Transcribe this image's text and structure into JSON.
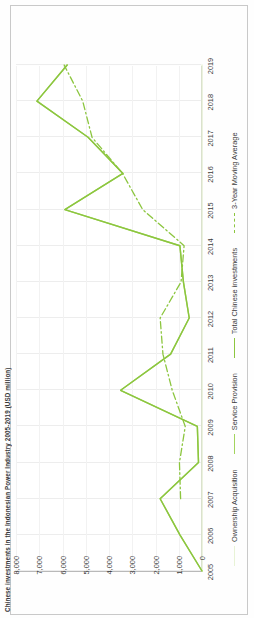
{
  "title": "Chinese investments in the Indonesian Power Industry 2005-2019 (USD million)",
  "axis": {
    "y_ticks": [
      "8,000",
      "7,000",
      "6,000",
      "5,000",
      "4,000",
      "3,000",
      "2,000",
      "1,000",
      "0"
    ],
    "x_ticks": [
      "2005",
      "2006",
      "2007",
      "2008",
      "2009",
      "2010",
      "2011",
      "2012",
      "2013",
      "2014",
      "2015",
      "2016",
      "2017",
      "2018",
      "2019"
    ]
  },
  "legend": {
    "items": [
      {
        "label": "Ownership Acquisition",
        "color": "#e8f3d6",
        "style": "solid"
      },
      {
        "label": "Service Provision",
        "color": "#a3d45e",
        "style": "solid"
      },
      {
        "label": "Total Chinese investments",
        "color": "#8cc63f",
        "style": "solid"
      },
      {
        "label": "3-Year Moving Average",
        "color": "#8cc63f",
        "style": "dashdot"
      }
    ]
  },
  "colors": {
    "total": "#8cc63f",
    "service": "#a3d45e",
    "ownership": "#e8f3d6",
    "moving_average": "#8cc63f",
    "grid": "#ededed",
    "axis": "#b9b9b9",
    "text": "#3c3c3c"
  },
  "chart_data": {
    "type": "line",
    "title": "Chinese investments in the Indonesian Power Industry 2005-2019 (USD million)",
    "xlabel": "",
    "ylabel": "USD million",
    "ylim": [
      0,
      8000
    ],
    "yticks": [
      0,
      1000,
      2000,
      3000,
      4000,
      5000,
      6000,
      7000,
      8000
    ],
    "grid": true,
    "legend_position": "bottom",
    "x": [
      "2005",
      "2006",
      "2007",
      "2008",
      "2009",
      "2010",
      "2011",
      "2012",
      "2013",
      "2014",
      "2015",
      "2016",
      "2017",
      "2018",
      "2019"
    ],
    "series": [
      {
        "name": "Ownership Acquisition",
        "style": "solid",
        "color": "#e8f3d6",
        "values": [
          0,
          0,
          0,
          0,
          0,
          0,
          0,
          0,
          0,
          0,
          0,
          0,
          0,
          0,
          0
        ]
      },
      {
        "name": "Service Provision",
        "style": "solid",
        "color": "#a3d45e",
        "values": [
          0,
          950,
          1800,
          150,
          200,
          3500,
          1350,
          550,
          800,
          950,
          5900,
          3400,
          4900,
          7100,
          5800
        ]
      },
      {
        "name": "Total Chinese investments",
        "style": "solid",
        "color": "#8cc63f",
        "values": [
          0,
          950,
          1800,
          150,
          200,
          3500,
          1350,
          550,
          800,
          950,
          5900,
          3400,
          4900,
          7100,
          5800
        ]
      },
      {
        "name": "3-Year Moving Average",
        "style": "dashdot",
        "color": "#8cc63f",
        "values": [
          null,
          null,
          920,
          970,
          720,
          1280,
          1680,
          1800,
          900,
          770,
          2550,
          3420,
          4730,
          5130,
          5930
        ]
      }
    ]
  }
}
